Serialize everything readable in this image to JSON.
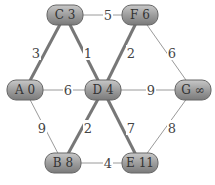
{
  "nodes": [
    {
      "id": "C",
      "label": "C 3",
      "x": 65,
      "y": 15
    },
    {
      "id": "F",
      "label": "F 6",
      "x": 140,
      "y": 15
    },
    {
      "id": "A",
      "label": "A 0",
      "x": 25,
      "y": 90
    },
    {
      "id": "D",
      "label": "D 4",
      "x": 103,
      "y": 90
    },
    {
      "id": "G",
      "label": "G ∞",
      "x": 193,
      "y": 90
    },
    {
      "id": "B",
      "label": "B 8",
      "x": 63,
      "y": 163
    },
    {
      "id": "E",
      "label": "E 11",
      "x": 140,
      "y": 163
    }
  ],
  "edges": [
    {
      "from": "A",
      "to": "C",
      "weight": "3",
      "thick": true,
      "lx": 36,
      "ly": 53
    },
    {
      "from": "C",
      "to": "D",
      "weight": "1",
      "thick": true,
      "lx": 88,
      "ly": 53
    },
    {
      "from": "C",
      "to": "F",
      "weight": "5",
      "thick": false,
      "lx": 108,
      "ly": 15
    },
    {
      "from": "D",
      "to": "F",
      "weight": "2",
      "thick": true,
      "lx": 131,
      "ly": 53
    },
    {
      "from": "F",
      "to": "G",
      "weight": "6",
      "thick": false,
      "lx": 172,
      "ly": 53
    },
    {
      "from": "A",
      "to": "D",
      "weight": "6",
      "thick": false,
      "lx": 68,
      "ly": 90
    },
    {
      "from": "D",
      "to": "G",
      "weight": "9",
      "thick": false,
      "lx": 151,
      "ly": 90
    },
    {
      "from": "A",
      "to": "B",
      "weight": "9",
      "thick": false,
      "lx": 42,
      "ly": 128
    },
    {
      "from": "D",
      "to": "B",
      "weight": "2",
      "thick": true,
      "lx": 88,
      "ly": 128
    },
    {
      "from": "D",
      "to": "E",
      "weight": "7",
      "thick": true,
      "lx": 131,
      "ly": 128
    },
    {
      "from": "G",
      "to": "E",
      "weight": "8",
      "thick": false,
      "lx": 172,
      "ly": 128
    },
    {
      "from": "B",
      "to": "E",
      "weight": "4",
      "thick": false,
      "lx": 108,
      "ly": 163
    }
  ],
  "colors": {
    "node_fill": "#9a9a9a",
    "node_edge": "#666666",
    "thin_edge": "#9a9a9a",
    "thick_edge": "#777777",
    "label": "#444444"
  }
}
